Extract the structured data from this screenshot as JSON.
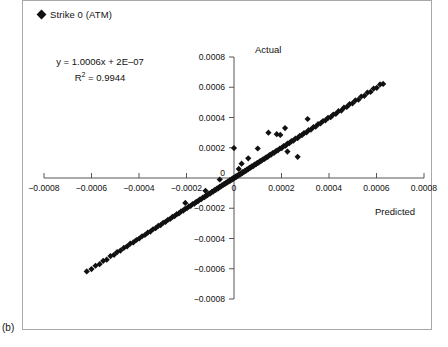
{
  "figure": {
    "panel_label": "(b)",
    "legend": [
      {
        "marker": "diamond",
        "label": "Strike 0 (ATM)",
        "color": "#111111"
      }
    ],
    "annotations": {
      "equation": "y = 1.0006x + 2E–07",
      "r_squared_prefix": "R",
      "r_squared_sup": "2",
      "r_squared_value": " = 0.9944"
    }
  },
  "chart_data": {
    "type": "scatter",
    "title": "",
    "xlabel": "Predicted",
    "ylabel": "Actual",
    "xlim": [
      -0.0008,
      0.0008
    ],
    "ylim": [
      -0.0008,
      0.0008
    ],
    "xticks": [
      -0.0008,
      -0.0006,
      -0.0004,
      -0.0002,
      0,
      0.0002,
      0.0004,
      0.0006,
      0.0008
    ],
    "xtick_labels": [
      "−0.0008",
      "−0.0006",
      "−0.0004",
      "−0.0002",
      "0",
      "0.0002",
      "0.0004",
      "0.0006",
      "0.0008"
    ],
    "yticks": [
      -0.0008,
      -0.0006,
      -0.0004,
      -0.0002,
      0,
      0.0002,
      0.0004,
      0.0006,
      0.0008
    ],
    "ytick_labels": [
      "−0.0008",
      "−0.0006",
      "−0.0004",
      "−0.0002",
      "0",
      "0.0002",
      "0.0004",
      "0.0006",
      "0.0008"
    ],
    "grid": false,
    "legend_position": "top-left",
    "axes_style": "crossed-at-origin",
    "marker": "diamond",
    "marker_color": "#111111",
    "fit_line": {
      "slope": 1.0006,
      "intercept": 2e-07,
      "r2": 0.9944
    },
    "series": [
      {
        "name": "Strike 0 (ATM)",
        "points": [
          [
            -0.00062,
            -0.000618
          ],
          [
            -0.0006,
            -0.000602
          ],
          [
            -0.000583,
            -0.00058
          ],
          [
            -0.000566,
            -0.00057
          ],
          [
            -0.000551,
            -0.000548
          ],
          [
            -0.000536,
            -0.00054
          ],
          [
            -0.00052,
            -0.000516
          ],
          [
            -0.000505,
            -0.000508
          ],
          [
            -0.000492,
            -0.00049
          ],
          [
            -0.000478,
            -0.00048
          ],
          [
            -0.000464,
            -0.000462
          ],
          [
            -0.00045,
            -0.000452
          ],
          [
            -0.000437,
            -0.000434
          ],
          [
            -0.000424,
            -0.000426
          ],
          [
            -0.000411,
            -0.00041
          ],
          [
            -0.000399,
            -0.0004
          ],
          [
            -0.000387,
            -0.000385
          ],
          [
            -0.000375,
            -0.000377
          ],
          [
            -0.000363,
            -0.000361
          ],
          [
            -0.000352,
            -0.000354
          ],
          [
            -0.000341,
            -0.000339
          ],
          [
            -0.00033,
            -0.000332
          ],
          [
            -0.000319,
            -0.000317
          ],
          [
            -0.000309,
            -0.000311
          ],
          [
            -0.000298,
            -0.000296
          ],
          [
            -0.000288,
            -0.00029
          ],
          [
            -0.000278,
            -0.000276
          ],
          [
            -0.000269,
            -0.000271
          ],
          [
            -0.000259,
            -0.000257
          ],
          [
            -0.00025,
            -0.000252
          ],
          [
            -0.000241,
            -0.000239
          ],
          [
            -0.000232,
            -0.000234
          ],
          [
            -0.000223,
            -0.000221
          ],
          [
            -0.000214,
            -0.000216
          ],
          [
            -0.000206,
            -0.000204
          ],
          [
            -0.000198,
            -0.0002
          ],
          [
            -0.00019,
            -0.000188
          ],
          [
            -0.000182,
            -0.000184
          ],
          [
            -0.000174,
            -0.000172
          ],
          [
            -0.000166,
            -0.000169
          ],
          [
            -0.000159,
            -0.000157
          ],
          [
            -0.000152,
            -0.000154
          ],
          [
            -0.000145,
            -0.000143
          ],
          [
            -0.000138,
            -0.00014
          ],
          [
            -0.000131,
            -0.000129
          ],
          [
            -0.000124,
            -0.000127
          ],
          [
            -0.000118,
            -0.000116
          ],
          [
            -0.000112,
            -0.000114
          ],
          [
            -0.000105,
            -0.000103
          ],
          [
            -9.9e-05,
            -0.000101
          ],
          [
            -9.3e-05,
            -9.1e-05
          ],
          [
            -8.8e-05,
            -9e-05
          ],
          [
            -8.2e-05,
            -8e-05
          ],
          [
            -7.7e-05,
            -7.9e-05
          ],
          [
            -7.1e-05,
            -6.9e-05
          ],
          [
            -6.6e-05,
            -6.8e-05
          ],
          [
            -6.1e-05,
            -5.9e-05
          ],
          [
            -5.6e-05,
            -5.8e-05
          ],
          [
            -5.1e-05,
            -4.9e-05
          ],
          [
            -4.7e-05,
            -4.8e-05
          ],
          [
            -4.2e-05,
            -4e-05
          ],
          [
            -3.8e-05,
            -3.9e-05
          ],
          [
            -3.4e-05,
            -3.2e-05
          ],
          [
            -3e-05,
            -3.1e-05
          ],
          [
            -2.6e-05,
            -2.4e-05
          ],
          [
            -2.2e-05,
            -2.3e-05
          ],
          [
            -1.8e-05,
            -1.6e-05
          ],
          [
            -1.5e-05,
            -1.7e-05
          ],
          [
            -1.1e-05,
            -9e-06
          ],
          [
            -8e-06,
            -1e-05
          ],
          [
            -5e-06,
            -3e-06
          ],
          [
            -2e-06,
            -4e-06
          ],
          [
            1e-06,
            2e-06
          ],
          [
            4e-06,
            3e-06
          ],
          [
            7e-06,
            9e-06
          ],
          [
            1e-05,
            8e-06
          ],
          [
            1.4e-05,
            1.6e-05
          ],
          [
            1.7e-05,
            1.5e-05
          ],
          [
            2.1e-05,
            2.3e-05
          ],
          [
            2.5e-05,
            2.2e-05
          ],
          [
            2.9e-05,
            3.1e-05
          ],
          [
            3.3e-05,
            3e-05
          ],
          [
            3.7e-05,
            3.9e-05
          ],
          [
            4.1e-05,
            3.8e-05
          ],
          [
            4.6e-05,
            4.8e-05
          ],
          [
            5e-05,
            4.7e-05
          ],
          [
            5.5e-05,
            5.7e-05
          ],
          [
            6e-05,
            5.8e-05
          ],
          [
            6.5e-05,
            6.7e-05
          ],
          [
            7e-05,
            6.8e-05
          ],
          [
            7.5e-05,
            7.7e-05
          ],
          [
            8.1e-05,
            7.9e-05
          ],
          [
            8.6e-05,
            8.8e-05
          ],
          [
            9.2e-05,
            9e-05
          ],
          [
            9.8e-05,
            0.0001
          ],
          [
            0.000104,
            0.000102
          ],
          [
            0.00011,
            0.000112
          ],
          [
            0.000116,
            0.000114
          ],
          [
            0.000122,
            0.000124
          ],
          [
            0.000129,
            0.000127
          ],
          [
            0.000135,
            0.000137
          ],
          [
            0.000142,
            0.00014
          ],
          [
            0.000149,
            0.000151
          ],
          [
            0.000156,
            0.000154
          ],
          [
            0.000163,
            0.000165
          ],
          [
            0.00017,
            0.000168
          ],
          [
            0.000178,
            0.00018
          ],
          [
            0.000185,
            0.000183
          ],
          [
            0.000193,
            0.000195
          ],
          [
            0.000201,
            0.000198
          ],
          [
            0.000209,
            0.000211
          ],
          [
            0.000217,
            0.000214
          ],
          [
            0.000225,
            0.000227
          ],
          [
            0.000233,
            0.00023
          ],
          [
            0.000242,
            0.000244
          ],
          [
            0.00025,
            0.000247
          ],
          [
            0.000259,
            0.000261
          ],
          [
            0.000268,
            0.000264
          ],
          [
            0.000277,
            0.000279
          ],
          [
            0.000286,
            0.000283
          ],
          [
            0.000295,
            0.000297
          ],
          [
            0.000305,
            0.000301
          ],
          [
            0.000314,
            0.000316
          ],
          [
            0.000324,
            0.00032
          ],
          [
            0.000334,
            0.000336
          ],
          [
            0.000344,
            0.00034
          ],
          [
            0.000354,
            0.000356
          ],
          [
            0.000364,
            0.000361
          ],
          [
            0.000375,
            0.000377
          ],
          [
            0.000385,
            0.000381
          ],
          [
            0.000396,
            0.000398
          ],
          [
            0.000407,
            0.000402
          ],
          [
            0.000418,
            0.00042
          ],
          [
            0.000429,
            0.000424
          ],
          [
            0.00044,
            0.000442
          ],
          [
            0.000452,
            0.000446
          ],
          [
            0.000463,
            0.000465
          ],
          [
            0.000475,
            0.00047
          ],
          [
            0.000487,
            0.000489
          ],
          [
            0.000499,
            0.000494
          ],
          [
            0.000511,
            0.000513
          ],
          [
            0.000524,
            0.000518
          ],
          [
            0.000536,
            0.000539
          ],
          [
            0.000549,
            0.000543
          ],
          [
            0.000562,
            0.000565
          ],
          [
            0.000575,
            0.000569
          ],
          [
            0.000588,
            0.000591
          ],
          [
            0.000601,
            0.000596
          ],
          [
            0.000615,
            0.000619
          ],
          [
            0.000628,
            0.000622
          ],
          [
            0.000145,
            0.0003
          ],
          [
            0.00018,
            0.00029
          ],
          [
            0.000195,
            0.000285
          ],
          [
            0.000225,
            0.000175
          ],
          [
            0.000268,
            0.00014
          ],
          [
            0.000215,
            0.00033
          ],
          [
            0.00031,
            0.00039
          ],
          [
            0.0001,
            0.000195
          ],
          [
            6e-05,
            0.00013
          ],
          [
            3.2e-05,
            9.5e-05
          ],
          [
            2e-05,
            6e-05
          ],
          [
            -6e-05,
            -1e-05
          ],
          [
            -0.00012,
            -8.5e-05
          ],
          [
            -0.000205,
            -0.000165
          ],
          [
            0.0,
            0.000198
          ]
        ]
      }
    ]
  }
}
